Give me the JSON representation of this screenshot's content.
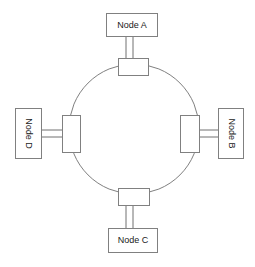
{
  "diagram": {
    "type": "ring-network",
    "background_color": "#ffffff",
    "line_color": "#808080",
    "text_color": "#1a1a1a",
    "ring": {
      "center_x": 134,
      "center_y": 129,
      "radius": 65,
      "shape": "circle"
    },
    "nodes": [
      {
        "id": "a",
        "label": "Node A",
        "position": "top",
        "orientation": "horizontal"
      },
      {
        "id": "b",
        "label": "Node B",
        "position": "right",
        "orientation": "vertical"
      },
      {
        "id": "c",
        "label": "Node C",
        "position": "bottom",
        "orientation": "horizontal"
      },
      {
        "id": "d",
        "label": "Node D",
        "position": "left",
        "orientation": "vertical"
      }
    ],
    "connectors": [
      {
        "id": "top",
        "attached_node": "a",
        "shape": "rectangle"
      },
      {
        "id": "right",
        "attached_node": "b",
        "shape": "rectangle"
      },
      {
        "id": "bottom",
        "attached_node": "c",
        "shape": "rectangle"
      },
      {
        "id": "left",
        "attached_node": "d",
        "shape": "rectangle"
      }
    ],
    "cables": [
      {
        "id": "cable-a",
        "from": "node-a",
        "to": "conn-top",
        "style": "double-line"
      },
      {
        "id": "cable-b",
        "from": "node-b",
        "to": "conn-right",
        "style": "double-line"
      },
      {
        "id": "cable-c",
        "from": "node-c",
        "to": "conn-bottom",
        "style": "double-line"
      },
      {
        "id": "cable-d",
        "from": "node-d",
        "to": "conn-left",
        "style": "double-line"
      }
    ]
  }
}
